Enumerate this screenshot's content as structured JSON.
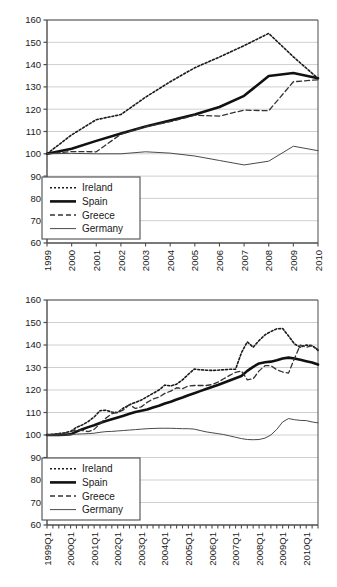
{
  "chart_data": [
    {
      "id": "annual",
      "type": "line",
      "title": "",
      "xlabel": "",
      "ylabel": "",
      "ylim": [
        60,
        160
      ],
      "ytick_step": 10,
      "yticks": [
        60,
        70,
        80,
        90,
        100,
        110,
        120,
        130,
        140,
        150,
        160
      ],
      "grid": true,
      "legend_position": "bottom-left",
      "categories": [
        "1999",
        "2000",
        "2001",
        "2002",
        "2003",
        "2004",
        "2005",
        "2006",
        "2007",
        "2008",
        "2009",
        "2010"
      ],
      "series": [
        {
          "name": "Ireland",
          "style": "dotted",
          "width": 1.6,
          "color": "#1a1a1a",
          "values": [
            100.0,
            108.5,
            115.3,
            117.6,
            125.4,
            132.3,
            138.6,
            143.4,
            148.5,
            154.0,
            143.5,
            133.8
          ]
        },
        {
          "name": "Spain",
          "style": "solid",
          "width": 2.6,
          "color": "#111111",
          "values": [
            100.0,
            102.3,
            105.8,
            109.1,
            112.2,
            114.9,
            117.6,
            121.0,
            126.0,
            134.9,
            136.2,
            133.9
          ]
        },
        {
          "name": "Greece",
          "style": "dashed",
          "width": 1.3,
          "color": "#333333",
          "values": [
            100.0,
            101.0,
            100.9,
            108.8,
            112.2,
            114.4,
            117.3,
            116.9,
            119.6,
            119.3,
            132.3,
            133.2
          ]
        },
        {
          "name": "Germany",
          "style": "solid",
          "width": 1.0,
          "color": "#4a4a4a",
          "values": [
            100.0,
            100.2,
            100.0,
            100.0,
            100.9,
            100.3,
            99.0,
            97.0,
            95.0,
            96.7,
            103.4,
            101.4
          ]
        }
      ]
    },
    {
      "id": "quarterly",
      "type": "line",
      "title": "",
      "xlabel": "",
      "ylabel": "",
      "ylim": [
        60,
        160
      ],
      "ytick_step": 10,
      "yticks": [
        60,
        70,
        80,
        90,
        100,
        110,
        120,
        130,
        140,
        150,
        160
      ],
      "grid": true,
      "legend_position": "bottom-left",
      "categories": [
        "1999Q1",
        "1999Q2",
        "1999Q3",
        "1999Q4",
        "2000Q1",
        "2000Q2",
        "2000Q3",
        "2000Q4",
        "2001Q1",
        "2001Q2",
        "2001Q3",
        "2001Q4",
        "2002Q1",
        "2002Q2",
        "2002Q3",
        "2002Q4",
        "2003Q1",
        "2003Q2",
        "2003Q3",
        "2003Q4",
        "2004Q1",
        "2004Q2",
        "2004Q3",
        "2004Q4",
        "2005Q1",
        "2005Q2",
        "2005Q3",
        "2005Q4",
        "2006Q1",
        "2006Q2",
        "2006Q3",
        "2006Q4",
        "2007Q1",
        "2007Q2",
        "2007Q3",
        "2007Q4",
        "2008Q1",
        "2008Q2",
        "2008Q3",
        "2008Q4",
        "2009Q1",
        "2009Q2",
        "2009Q3",
        "2009Q4",
        "2010Q1",
        "2010Q2",
        "2010Q3"
      ],
      "xtick_labels": [
        "1999Q1",
        "2000Q1",
        "2001Q1",
        "2002Q1",
        "2003Q1",
        "2004Q1",
        "2005Q1",
        "2006Q1",
        "2007Q1",
        "2008Q1",
        "2009Q1",
        "2010Q1"
      ],
      "xtick_every": 4,
      "series": [
        {
          "name": "Ireland",
          "style": "dotted",
          "width": 1.6,
          "color": "#1a1a1a",
          "values": [
            100.0,
            100.3,
            100.6,
            101.0,
            101.6,
            103.4,
            104.5,
            106.0,
            108.0,
            110.8,
            111.0,
            110.2,
            110.0,
            112.0,
            113.5,
            114.5,
            115.5,
            117.0,
            118.5,
            120.0,
            122.2,
            121.8,
            122.6,
            124.5,
            127.0,
            129.3,
            129.0,
            128.8,
            128.7,
            128.8,
            129.0,
            129.2,
            129.2,
            136.5,
            141.4,
            139.0,
            142.0,
            144.5,
            146.0,
            147.2,
            147.3,
            144.0,
            140.5,
            139.0,
            140.0,
            139.7,
            137.6
          ]
        },
        {
          "name": "Spain",
          "style": "solid",
          "width": 2.6,
          "color": "#111111",
          "values": [
            100.0,
            100.0,
            100.0,
            100.1,
            100.3,
            101.5,
            102.6,
            103.5,
            104.3,
            105.3,
            106.2,
            107.0,
            107.8,
            108.6,
            109.4,
            110.2,
            110.8,
            111.3,
            112.2,
            113.0,
            114.0,
            114.8,
            115.8,
            116.7,
            117.7,
            118.6,
            119.5,
            120.4,
            121.3,
            122.2,
            123.2,
            124.2,
            125.2,
            126.2,
            128.5,
            130.3,
            131.8,
            132.3,
            132.6,
            133.2,
            134.0,
            134.4,
            134.0,
            133.4,
            132.8,
            132.2,
            131.3
          ]
        },
        {
          "name": "Greece",
          "style": "dashed",
          "width": 1.3,
          "color": "#333333",
          "values": [
            100.0,
            100.2,
            100.5,
            100.8,
            101.5,
            102.3,
            102.0,
            101.5,
            102.5,
            105.0,
            107.5,
            109.5,
            110.0,
            111.2,
            113.5,
            111.8,
            112.5,
            114.5,
            116.0,
            116.8,
            118.5,
            119.5,
            121.0,
            120.6,
            121.8,
            122.0,
            122.0,
            122.0,
            122.4,
            123.5,
            125.0,
            126.5,
            127.8,
            128.5,
            124.5,
            125.0,
            128.5,
            130.8,
            130.8,
            129.0,
            128.0,
            127.5,
            134.0,
            140.0,
            139.0,
            139.8,
            138.0
          ]
        },
        {
          "name": "Germany",
          "style": "solid",
          "width": 1.0,
          "color": "#4a4a4a",
          "values": [
            100.0,
            100.0,
            100.0,
            100.0,
            100.2,
            100.4,
            100.5,
            100.6,
            100.8,
            101.2,
            101.5,
            101.6,
            101.8,
            102.0,
            102.2,
            102.4,
            102.6,
            102.8,
            102.9,
            103.0,
            103.0,
            103.0,
            102.9,
            102.8,
            102.8,
            102.6,
            102.0,
            101.4,
            101.0,
            100.6,
            100.2,
            99.6,
            99.0,
            98.4,
            98.0,
            97.9,
            98.0,
            98.6,
            100.0,
            102.5,
            105.8,
            107.3,
            106.8,
            106.5,
            106.4,
            105.8,
            105.4
          ]
        }
      ]
    }
  ],
  "legend": {
    "entries": [
      {
        "label": "Ireland",
        "style": "dotted"
      },
      {
        "label": "Spain",
        "style": "solid-thick"
      },
      {
        "label": "Greece",
        "style": "dashed"
      },
      {
        "label": "Germany",
        "style": "solid-thin"
      }
    ]
  },
  "colors": {
    "grid": "#cfcfcf",
    "axis": "#4d4d4d",
    "text": "#1a1a1a",
    "legend_border": "#4d4d4d",
    "background": "#ffffff"
  }
}
